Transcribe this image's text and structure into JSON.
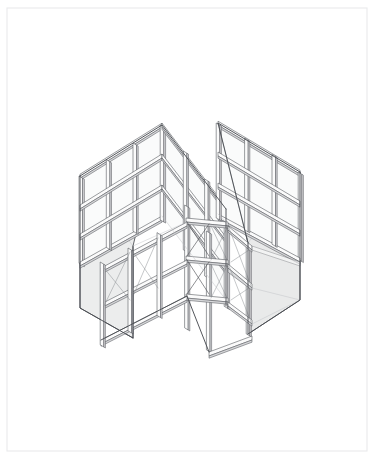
{
  "sheet": {
    "title": "Isometric Framed Enclosure",
    "background_color": "#ffffff",
    "width": 374,
    "height": 457,
    "border": {
      "name": "page-border",
      "color": "#e9eaec",
      "stroke_width": 1.1,
      "x": 7.0,
      "y": 8.0,
      "w": 360.0,
      "h": 443.0
    }
  },
  "drawing": {
    "type": "isometric-line-drawing",
    "subject": "modular steel-framed enclosure with two hinged wing panels and central braced tower",
    "projection": "isometric",
    "palette": {
      "line": "#4a4d52",
      "line_light": "#8d9095",
      "line_faint": "#b9bcc0",
      "panel_fill": "#eceded",
      "panel_fill_dark": "#e2e3e4",
      "member_fill": "#fbfbfb",
      "member_shade": "#d8d9db",
      "white": "#ffffff"
    },
    "stroke_widths": {
      "outline": 0.95,
      "member": 0.6,
      "detail": 0.45
    },
    "components": [
      {
        "name": "left-wing-panel",
        "label": "Left wing panel (shaded face)",
        "fill": "#eceded"
      },
      {
        "name": "right-wing-panel",
        "label": "Right wing panel (shaded face)",
        "fill": "#e9eaea"
      },
      {
        "name": "left-grid-frame",
        "label": "Left glazing grid frame",
        "bays_x": 3,
        "bays_y": 3
      },
      {
        "name": "right-grid-frame",
        "label": "Right glazing grid frame",
        "bays_x": 3,
        "bays_y": 3
      },
      {
        "name": "center-braced-tower",
        "label": "Central braced truss tower",
        "bays": 3
      },
      {
        "name": "floor-grid",
        "label": "Floor level grid plane",
        "bays": 4
      },
      {
        "name": "cross-bracing",
        "label": "Diagonal X cross-bracing",
        "count": 6
      }
    ]
  }
}
